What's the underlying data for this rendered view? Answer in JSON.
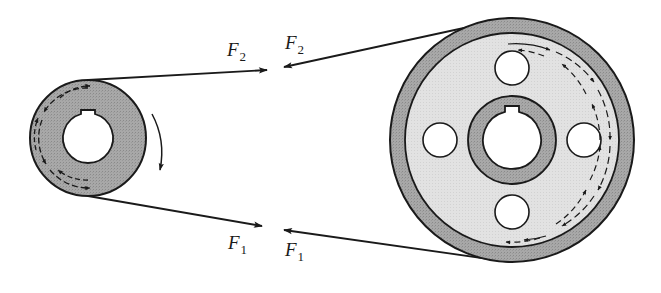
{
  "figure": {
    "type": "belt-drive",
    "colors": {
      "background": "#ffffff",
      "line": "#1a1a1a",
      "pulley_dark": "#a3a3a3",
      "pulley_light": "#e0e0e0",
      "hole": "#ffffff"
    },
    "labels": {
      "tight_left": {
        "symbol": "F",
        "subscript": "2"
      },
      "tight_right": {
        "symbol": "F",
        "subscript": "2"
      },
      "slack_left": {
        "symbol": "F",
        "subscript": "1"
      },
      "slack_right": {
        "symbol": "F",
        "subscript": "1"
      }
    },
    "small_pulley": {
      "cx": 88,
      "cy": 138,
      "r_outer": 58,
      "r_bore": 25,
      "rotation": "clockwise"
    },
    "large_pulley": {
      "cx": 512,
      "cy": 140,
      "r_outer": 122,
      "r_rim_inner": 107,
      "r_hub": 44,
      "r_bore": 29,
      "holes": 4,
      "hole_radius": 17,
      "hole_distance": 72
    }
  }
}
